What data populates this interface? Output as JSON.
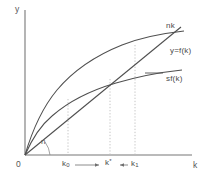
{
  "figure": {
    "type": "solow-growth-diagram",
    "background": "#ffffff",
    "stroke_color": "#555555",
    "dotted_color": "#b5b5b5",
    "text_color": "#4a4a4a"
  },
  "axes": {
    "y_label": "y",
    "x_label": "k",
    "origin_label": "0",
    "x_axis_y_px": 155,
    "y_axis_x_px": 25,
    "x_range_px": [
      25,
      190
    ],
    "y_range_px": [
      10,
      155
    ]
  },
  "angle": {
    "label": "n",
    "meaning": "slope of the nk line"
  },
  "curves": {
    "nk": {
      "label": "nk",
      "type": "line",
      "description": "straight ray from origin with slope n",
      "points_px": [
        [
          25,
          155
        ],
        [
          180,
          28
        ]
      ]
    },
    "production": {
      "label": "y=f(k)",
      "type": "concave-curve",
      "description": "production function per worker",
      "points_px": [
        [
          25,
          155
        ],
        [
          45,
          100
        ],
        [
          70,
          72
        ],
        [
          100,
          54
        ],
        [
          130,
          42
        ],
        [
          160,
          35
        ],
        [
          180,
          32
        ]
      ]
    },
    "saving": {
      "label": "sf(k)",
      "type": "concave-curve",
      "description": "saving per worker, s times f(k)",
      "points_px": [
        [
          25,
          155
        ],
        [
          45,
          122
        ],
        [
          70,
          100
        ],
        [
          100,
          85
        ],
        [
          130,
          76
        ],
        [
          160,
          71
        ],
        [
          180,
          69
        ]
      ]
    }
  },
  "markers": {
    "k0": {
      "label": "k",
      "sub": "0",
      "x_px": 68,
      "description": "capital below steady state"
    },
    "kstar": {
      "label": "k",
      "sup": "*",
      "x_px": 110,
      "description": "steady-state capital per worker"
    },
    "k1": {
      "label": "k",
      "sub": "1",
      "x_px": 135,
      "description": "capital above steady state"
    }
  },
  "arrows": {
    "left_to_star": {
      "direction": "right",
      "from_px": 75,
      "to_px": 101,
      "y_px": 165
    },
    "right_to_star": {
      "direction": "left",
      "from_px": 128,
      "to_px": 118,
      "y_px": 165
    }
  },
  "dotted_guides": [
    {
      "name": "k0-guide",
      "x_px": 68,
      "top_px": 100,
      "bottom_px": 155
    },
    {
      "name": "kstar-guide",
      "x_px": 110,
      "top_px": 80,
      "bottom_px": 155
    },
    {
      "name": "k1-guide",
      "x_px": 135,
      "top_px": 45,
      "bottom_px": 155
    }
  ]
}
